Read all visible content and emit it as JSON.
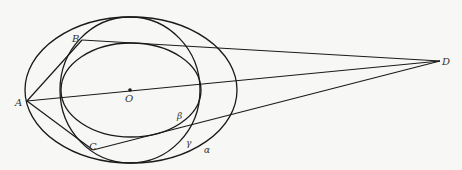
{
  "diagram": {
    "type": "geometry",
    "points": {
      "A": {
        "label": "A",
        "x": 27,
        "y": 101
      },
      "B": {
        "label": "B",
        "x": 82,
        "y": 40
      },
      "C": {
        "label": "C",
        "x": 93,
        "y": 150
      },
      "D": {
        "label": "D",
        "x": 440,
        "y": 61
      },
      "O": {
        "label": "O",
        "x": 130,
        "y": 90
      }
    },
    "curves": {
      "alpha": {
        "label": "α",
        "cx": 131,
        "cy": 90,
        "rx": 106,
        "ry": 73
      },
      "gamma": {
        "label": "γ",
        "cx": 130,
        "cy": 90,
        "rx": 70,
        "ry": 73
      },
      "beta": {
        "label": "β",
        "cx": 131,
        "cy": 90,
        "rx": 70,
        "ry": 47
      }
    },
    "segments": [
      {
        "from": "A",
        "to": "B"
      },
      {
        "from": "A",
        "to": "C"
      },
      {
        "from": "A",
        "to": "D"
      },
      {
        "from": "B",
        "to": "D"
      },
      {
        "from": "C",
        "to": "D"
      }
    ],
    "labels": {
      "A": "A",
      "B": "B",
      "C": "C",
      "D": "D",
      "O": "O",
      "alpha": "α",
      "beta": "β",
      "gamma": "γ"
    }
  }
}
